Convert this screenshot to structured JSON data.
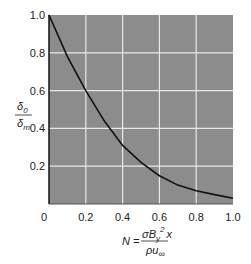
{
  "chart_data": {
    "type": "line",
    "title": "",
    "xlabel": "N = σB_y^2 x / ρu_∞",
    "ylabel": "δ0 / δm",
    "xlim": [
      0,
      1.0
    ],
    "ylim": [
      0,
      1.0
    ],
    "grid": true,
    "x_ticks": [
      "0",
      "0.2",
      "0.4",
      "0.6",
      "0.8",
      "1.0"
    ],
    "y_ticks": [
      "0.2",
      "0.4",
      "0.6",
      "0.8",
      "1.0"
    ],
    "series": [
      {
        "name": "δ0/δm",
        "x": [
          0,
          0.1,
          0.2,
          0.3,
          0.4,
          0.5,
          0.6,
          0.7,
          0.8,
          0.9,
          1.0
        ],
        "values": [
          1.0,
          0.78,
          0.6,
          0.44,
          0.31,
          0.22,
          0.15,
          0.1,
          0.07,
          0.05,
          0.03
        ]
      }
    ],
    "colors": {
      "plot_bg": "#8c8c8c",
      "grid": "#e8e8e8",
      "line": "#111111"
    }
  },
  "labels": {
    "y_num": "δ",
    "y_num_sub": "0",
    "y_den": "δ",
    "y_den_sub": "m",
    "x_lhs": "N =",
    "x_num": "σB",
    "x_num_sub": "y",
    "x_num_sup": "2",
    "x_num_tail": "x",
    "x_den": "ρu",
    "x_den_sub": "∞"
  }
}
